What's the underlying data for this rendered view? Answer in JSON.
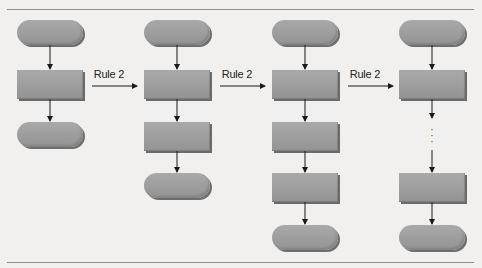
{
  "diagram": {
    "type": "flowchart-stacking-rule",
    "colors": {
      "background": "#f1f0ee",
      "shape_fill": "#9c9c9c",
      "shape_shadow": "#6e6e6e",
      "arrow": "#1a1a1a",
      "rule_line": "#8e8e8e"
    },
    "transitions": [
      {
        "label": "Rule 2",
        "from_column": 1,
        "to_column": 2
      },
      {
        "label": "Rule 2",
        "from_column": 2,
        "to_column": 3
      },
      {
        "label": "Rule 2",
        "from_column": 3,
        "to_column": 4
      }
    ],
    "columns": [
      {
        "index": 1,
        "shapes": [
          "oval",
          "rect",
          "oval"
        ]
      },
      {
        "index": 2,
        "shapes": [
          "oval",
          "rect",
          "rect",
          "oval"
        ]
      },
      {
        "index": 3,
        "shapes": [
          "oval",
          "rect",
          "rect",
          "rect",
          "oval"
        ]
      },
      {
        "index": 4,
        "shapes": [
          "oval",
          "rect",
          "ellipsis",
          "rect",
          "oval"
        ]
      }
    ],
    "ellipsis_glyph": "⋮"
  }
}
